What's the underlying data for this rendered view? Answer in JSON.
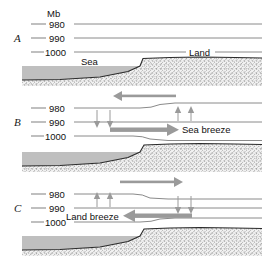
{
  "figure": {
    "unit_label": "Mb",
    "colors": {
      "isobar": "#8a8a8a",
      "arrow": "#9a9a9a",
      "sea": "#bfbfbf",
      "coast": "#2b2b2b",
      "text": "#111111"
    }
  },
  "panels": [
    {
      "letter": "A",
      "isobars": [
        {
          "value": "980"
        },
        {
          "value": "990"
        },
        {
          "value": "1000"
        }
      ],
      "terrain_labels": [
        {
          "text": "Sea"
        },
        {
          "text": "Land"
        }
      ],
      "arrows": [],
      "breeze_label": ""
    },
    {
      "letter": "B",
      "isobars": [
        {
          "value": "980"
        },
        {
          "value": "990"
        },
        {
          "value": "1000"
        }
      ],
      "terrain_labels": [],
      "arrows": [
        {
          "name": "upper-return-flow",
          "direction": "left",
          "style": "thick"
        },
        {
          "name": "surface-flow",
          "direction": "right",
          "style": "thick"
        },
        {
          "name": "subsidence-over-sea",
          "direction": "down",
          "style": "thin",
          "count": 2
        },
        {
          "name": "ascent-over-land",
          "direction": "up",
          "style": "thin",
          "count": 2
        }
      ],
      "breeze_label": "Sea breeze"
    },
    {
      "letter": "C",
      "isobars": [
        {
          "value": "980"
        },
        {
          "value": "990"
        },
        {
          "value": "1000"
        }
      ],
      "terrain_labels": [],
      "arrows": [
        {
          "name": "upper-return-flow",
          "direction": "right",
          "style": "thick"
        },
        {
          "name": "surface-flow",
          "direction": "left",
          "style": "thick"
        },
        {
          "name": "ascent-over-sea",
          "direction": "up",
          "style": "thin",
          "count": 2
        },
        {
          "name": "subsidence-over-land",
          "direction": "down",
          "style": "thin",
          "count": 2
        }
      ],
      "breeze_label": "Land breeze"
    }
  ]
}
